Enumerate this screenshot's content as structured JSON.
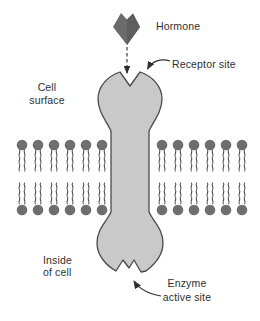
{
  "labels": {
    "hormone": "Hormone",
    "receptor_site": "Receptor site",
    "cell_surface": [
      "Cell",
      "surface"
    ],
    "inside_of_cell": [
      "Inside",
      "of cell"
    ],
    "enzyme_active_site": [
      "Enzyme",
      "active site"
    ]
  },
  "colors": {
    "background": "#ffffff",
    "receptor_fill": "#c9c9c9",
    "receptor_outline": "#4a4a4a",
    "hormone_fill": "#6b6b6b",
    "hormone_facet": "#5e5e5e",
    "lipid_head": "#6e6e6e",
    "lipid_tail": "#4a4a4a",
    "text": "#2f2f2f",
    "arrow": "#2f2f2f"
  },
  "membrane": {
    "rows": 2,
    "lipids_per_row_left": 6,
    "lipids_per_row_right": 6
  }
}
